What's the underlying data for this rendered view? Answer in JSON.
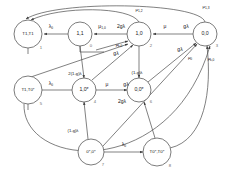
{
  "diagram": {
    "type": "markov-state-transition-diagram",
    "title": "",
    "nodes": [
      {
        "id": "n1",
        "label": "T1,T1",
        "index": "1",
        "cx": 28,
        "cy": 34,
        "r": 14
      },
      {
        "id": "n0",
        "label": "1,1",
        "index": "0",
        "cx": 80,
        "cy": 34,
        "r": 12
      },
      {
        "id": "n2",
        "label": "1,0",
        "index": "2",
        "cx": 139,
        "cy": 34,
        "r": 12
      },
      {
        "id": "n3",
        "label": "0,0",
        "index": "3",
        "cx": 205,
        "cy": 34,
        "r": 12
      },
      {
        "id": "n5",
        "label": "T1,T0*",
        "index": "5",
        "cx": 28,
        "cy": 90,
        "r": 14
      },
      {
        "id": "n4",
        "label": "1,0*",
        "index": "4",
        "cx": 84,
        "cy": 90,
        "r": 12
      },
      {
        "id": "n6",
        "label": "0,0*",
        "index": "6",
        "cx": 139,
        "cy": 90,
        "r": 12
      },
      {
        "id": "n7",
        "label": "0*,0*",
        "index": "7",
        "cx": 91,
        "cy": 152,
        "r": 13
      },
      {
        "id": "n8",
        "label": "T0*,T0*",
        "index": "8",
        "cx": 157,
        "cy": 152,
        "r": 14
      }
    ],
    "edge_labels": [
      {
        "id": "e_lambda0_top",
        "base": "λ",
        "sub": "0",
        "x": 51,
        "y": 27
      },
      {
        "id": "e_mu10",
        "base": "μ",
        "sub": "1,0",
        "x": 102,
        "y": 27
      },
      {
        "id": "e_2glambda_top",
        "base": "2gλ",
        "sub": "",
        "x": 121,
        "y": 27
      },
      {
        "id": "e_mu_top",
        "base": "μ",
        "sub": "",
        "x": 165,
        "y": 27
      },
      {
        "id": "e_glambda_top",
        "base": "gλ",
        "sub": "",
        "x": 186,
        "y": 27
      },
      {
        "id": "e_mu12",
        "base": "μ",
        "sub": "1,2",
        "x": 139,
        "y": 10
      },
      {
        "id": "e_mu13",
        "base": "μ",
        "sub": "1,3",
        "x": 206,
        "y": 7
      },
      {
        "id": "e_muk0_top",
        "base": "μ",
        "sub": "k,0",
        "x": 119,
        "y": 45
      },
      {
        "id": "e_glambda_diag1",
        "base": "gλ",
        "sub": "",
        "x": 116,
        "y": 54
      },
      {
        "id": "e_glambda_right",
        "base": "gλ",
        "sub": "",
        "x": 180,
        "y": 50
      },
      {
        "id": "e_mu0_right",
        "base": "μ",
        "sub": "0",
        "x": 190,
        "y": 58
      },
      {
        "id": "e_muk0_right",
        "base": "μ",
        "sub": "k,0",
        "x": 211,
        "y": 59
      },
      {
        "id": "e_2_1mg_lambda",
        "base": "2(1-g)λ",
        "sub": "",
        "x": 75,
        "y": 74
      },
      {
        "id": "e_1mg_lambda_mid",
        "base": "(1-g)λ",
        "sub": "",
        "x": 137,
        "y": 73
      },
      {
        "id": "e_lambda0_mid",
        "base": "λ",
        "sub": "0",
        "x": 51,
        "y": 84
      },
      {
        "id": "e_mu_mid",
        "base": "μ",
        "sub": "",
        "x": 107,
        "y": 85
      },
      {
        "id": "e_glambda_mid",
        "base": "gλ",
        "sub": "",
        "x": 126,
        "y": 85
      },
      {
        "id": "e_2glambda_low",
        "base": "2gλ",
        "sub": "",
        "x": 122,
        "y": 102
      },
      {
        "id": "e_1mg_lambda_low",
        "base": "(1-g)λ",
        "sub": "",
        "x": 73,
        "y": 131
      },
      {
        "id": "e_lambda0_bot",
        "base": "λ",
        "sub": "0",
        "x": 124,
        "y": 145
      }
    ],
    "colors": {
      "background": "#ffffff",
      "node_stroke": "#5a5a5a",
      "edge_stroke": "#4a4a4a",
      "label_text": "#111111",
      "index_text": "#6b6b6b"
    }
  }
}
